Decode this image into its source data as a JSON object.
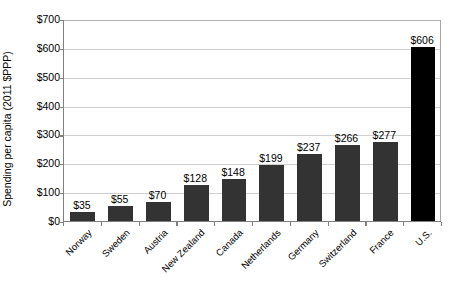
{
  "chart_data": {
    "type": "bar",
    "title": "",
    "xlabel": "",
    "ylabel": "Spending per capita (2011 $PPP)",
    "ylim": [
      0,
      700
    ],
    "ytick_labels": [
      "$700",
      "$600",
      "$500",
      "$400",
      "$300",
      "$200",
      "$100",
      "$0"
    ],
    "ytick_values": [
      700,
      600,
      500,
      400,
      300,
      200,
      100,
      0
    ],
    "grid": true,
    "legend": "none",
    "categories": [
      "Norway",
      "Sweden",
      "Austria",
      "New Zealand",
      "Canada",
      "Netherlands",
      "Germany",
      "Switzerland",
      "France",
      "U.S."
    ],
    "values": [
      35,
      55,
      70,
      128,
      148,
      199,
      237,
      266,
      277,
      606
    ],
    "data_labels": [
      "$35",
      "$55",
      "$70",
      "$128",
      "$148",
      "$199",
      "$237",
      "$266",
      "$277",
      "$606"
    ],
    "highlight_index": 9,
    "colors": {
      "bar": "#333333",
      "bar_highlight": "#000000",
      "gridline": "#d0d0d0",
      "axis": "#808080",
      "background": "#ffffff",
      "text": "#000000"
    }
  }
}
